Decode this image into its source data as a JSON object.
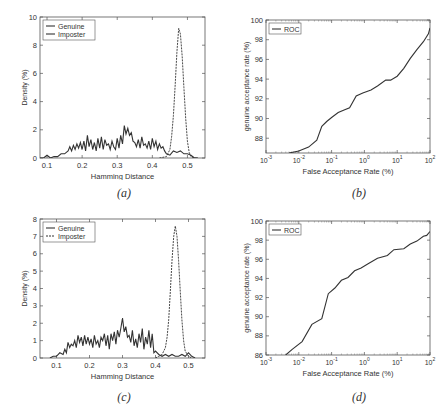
{
  "chart_data": [
    {
      "id": "a",
      "type": "line",
      "caption": "(a)",
      "xlabel": "Hamming Distance",
      "ylabel": "Density (%)",
      "xlim": [
        0.08,
        0.55
      ],
      "ylim": [
        0,
        10
      ],
      "xticks": [
        0.1,
        0.2,
        0.3,
        0.4,
        0.5
      ],
      "xtick_labels": [
        "0.1",
        "0.2",
        "0.3",
        "0.4",
        "0.5"
      ],
      "yticks": [
        0,
        2,
        4,
        6,
        8,
        10
      ],
      "ytick_labels": [
        "0",
        "2",
        "4",
        "6",
        "8",
        "10"
      ],
      "legend": {
        "position": "upper left",
        "entries": [
          "Genuine",
          "Imposter"
        ]
      },
      "series": [
        {
          "name": "Genuine",
          "style": "solid",
          "x": [
            0.08,
            0.09,
            0.1,
            0.11,
            0.12,
            0.13,
            0.14,
            0.15,
            0.16,
            0.165,
            0.17,
            0.175,
            0.18,
            0.185,
            0.19,
            0.195,
            0.2,
            0.205,
            0.21,
            0.215,
            0.22,
            0.225,
            0.23,
            0.235,
            0.24,
            0.245,
            0.25,
            0.255,
            0.26,
            0.265,
            0.27,
            0.275,
            0.28,
            0.285,
            0.29,
            0.295,
            0.3,
            0.305,
            0.31,
            0.315,
            0.32,
            0.325,
            0.33,
            0.335,
            0.34,
            0.345,
            0.35,
            0.355,
            0.36,
            0.365,
            0.37,
            0.375,
            0.38,
            0.385,
            0.39,
            0.395,
            0.4,
            0.405,
            0.41,
            0.415,
            0.42,
            0.425,
            0.43,
            0.435,
            0.44,
            0.45,
            0.46,
            0.47,
            0.48,
            0.49,
            0.5,
            0.51,
            0.52,
            0.53
          ],
          "values": [
            0,
            0,
            0.2,
            0,
            0.1,
            0.1,
            0.3,
            0.3,
            0.5,
            0.8,
            0.5,
            0.9,
            0.6,
            1.0,
            0.7,
            1.1,
            0.6,
            1.2,
            0.5,
            1.6,
            0.8,
            1.3,
            0.6,
            1.1,
            0.5,
            1.4,
            0.7,
            1.5,
            0.6,
            1.3,
            0.9,
            1.0,
            0.6,
            1.2,
            0.8,
            0.6,
            1.4,
            0.7,
            1.6,
            1.0,
            2.3,
            1.7,
            2.1,
            1.6,
            1.8,
            1.2,
            1.1,
            0.8,
            1.3,
            0.7,
            1.5,
            0.9,
            1.0,
            0.7,
            1.2,
            0.6,
            1.4,
            0.8,
            1.2,
            0.6,
            1.0,
            0.7,
            0.8,
            0.5,
            0.3,
            0.2,
            0.5,
            0.4,
            0.5,
            0.3,
            0.3,
            0.2,
            0,
            0
          ]
        },
        {
          "name": "Imposter",
          "style": "dashed",
          "x": [
            0.42,
            0.44,
            0.45,
            0.455,
            0.46,
            0.465,
            0.47,
            0.475,
            0.48,
            0.485,
            0.49,
            0.495,
            0.5,
            0.505,
            0.51,
            0.52,
            0.53
          ],
          "values": [
            0,
            0.1,
            0.6,
            1.5,
            3.0,
            5.2,
            7.5,
            9.2,
            8.8,
            7.2,
            5.0,
            2.8,
            1.2,
            0.4,
            0.1,
            0,
            0
          ]
        }
      ]
    },
    {
      "id": "b",
      "type": "line",
      "caption": "(b)",
      "xlabel": "False Acceptance Rate (%)",
      "ylabel": "genuine acceptance rate (%)",
      "xscale": "log",
      "xlim": [
        0.001,
        100
      ],
      "ylim": [
        86.5,
        100
      ],
      "xticks": [
        0.001,
        0.01,
        0.1,
        1,
        10,
        100
      ],
      "xtick_labels": [
        "10^-3",
        "10^-2",
        "10^-1",
        "10^0",
        "10^1",
        "10^2"
      ],
      "yticks": [
        88,
        90,
        92,
        94,
        96,
        98,
        100
      ],
      "ytick_labels": [
        "88",
        "90",
        "92",
        "94",
        "96",
        "98",
        "100"
      ],
      "legend": {
        "position": "upper left",
        "entries": [
          "ROC"
        ]
      },
      "series": [
        {
          "name": "ROC",
          "style": "solid",
          "x_log10": [
            -2.3,
            -2.0,
            -1.7,
            -1.45,
            -1.3,
            -1.15,
            -1.0,
            -0.8,
            -0.6,
            -0.45,
            -0.25,
            -0.05,
            0.2,
            0.4,
            0.65,
            0.8,
            1.0,
            1.2,
            1.4,
            1.6,
            1.8,
            1.95,
            2.0
          ],
          "values": [
            86.5,
            86.7,
            87.1,
            87.8,
            89.2,
            89.7,
            90.1,
            90.6,
            90.9,
            91.1,
            92.3,
            92.6,
            92.9,
            93.3,
            93.9,
            93.9,
            94.3,
            95.1,
            96.1,
            97.0,
            97.8,
            98.6,
            99.2
          ]
        }
      ]
    },
    {
      "id": "c",
      "type": "line",
      "caption": "(c)",
      "xlabel": "Hamming Distance",
      "ylabel": "Density (%)",
      "xlim": [
        0.05,
        0.55
      ],
      "ylim": [
        0,
        8
      ],
      "xticks": [
        0.1,
        0.2,
        0.3,
        0.4,
        0.5
      ],
      "xtick_labels": [
        "0.1",
        "0.2",
        "0.3",
        "0.4",
        "0.5"
      ],
      "yticks": [
        0,
        1,
        2,
        3,
        4,
        5,
        6,
        7,
        8
      ],
      "ytick_labels": [
        "0",
        "1",
        "2",
        "3",
        "4",
        "5",
        "6",
        "7",
        "8"
      ],
      "legend": {
        "position": "upper left",
        "entries": [
          "Genuine",
          "Imposter"
        ]
      },
      "series": [
        {
          "name": "Genuine",
          "style": "solid",
          "x": [
            0.08,
            0.09,
            0.1,
            0.11,
            0.12,
            0.125,
            0.13,
            0.135,
            0.14,
            0.145,
            0.15,
            0.155,
            0.16,
            0.165,
            0.17,
            0.175,
            0.18,
            0.185,
            0.19,
            0.195,
            0.2,
            0.205,
            0.21,
            0.215,
            0.22,
            0.225,
            0.23,
            0.235,
            0.24,
            0.245,
            0.25,
            0.255,
            0.26,
            0.265,
            0.27,
            0.275,
            0.28,
            0.285,
            0.29,
            0.295,
            0.3,
            0.305,
            0.31,
            0.315,
            0.32,
            0.325,
            0.33,
            0.335,
            0.34,
            0.345,
            0.35,
            0.355,
            0.36,
            0.365,
            0.37,
            0.375,
            0.38,
            0.385,
            0.39,
            0.395,
            0.4,
            0.41,
            0.42,
            0.43,
            0.44,
            0.45,
            0.46,
            0.47,
            0.48,
            0.49,
            0.5,
            0.51,
            0.52
          ],
          "values": [
            0,
            0.1,
            0.1,
            0.3,
            0.2,
            0.5,
            0.3,
            0.9,
            0.6,
            0.8,
            0.7,
            1.0,
            0.6,
            1.3,
            0.9,
            1.2,
            0.7,
            1.3,
            0.8,
            1.2,
            0.8,
            1.1,
            0.6,
            1.3,
            0.8,
            1.0,
            0.6,
            1.2,
            1.0,
            1.4,
            0.7,
            1.3,
            0.5,
            1.4,
            1.0,
            1.5,
            0.8,
            1.6,
            1.2,
            1.7,
            2.3,
            1.5,
            1.8,
            1.2,
            1.3,
            0.9,
            1.6,
            0.7,
            1.1,
            0.6,
            1.4,
            0.9,
            1.7,
            0.5,
            1.2,
            0.8,
            1.6,
            0.6,
            1.4,
            0.3,
            0.4,
            0.2,
            0.1,
            0.2,
            0.1,
            0.2,
            0.1,
            0.1,
            0.2,
            0.1,
            0.3,
            0.1,
            0
          ]
        },
        {
          "name": "Imposter",
          "style": "dashed",
          "x": [
            0.4,
            0.42,
            0.43,
            0.435,
            0.44,
            0.445,
            0.45,
            0.455,
            0.46,
            0.465,
            0.47,
            0.475,
            0.48,
            0.485,
            0.49,
            0.5,
            0.51
          ],
          "values": [
            0,
            0.2,
            0.6,
            1.2,
            2.2,
            3.8,
            5.6,
            7.0,
            7.6,
            7.0,
            5.6,
            3.8,
            2.2,
            1.0,
            0.4,
            0.1,
            0
          ]
        }
      ]
    },
    {
      "id": "d",
      "type": "line",
      "caption": "(d)",
      "xlabel": "False Acceptance Rate (%)",
      "ylabel": "genuine acceptance rate (%)",
      "xscale": "log",
      "xlim": [
        0.001,
        100
      ],
      "ylim": [
        86,
        100
      ],
      "xticks": [
        0.001,
        0.01,
        0.1,
        1,
        10,
        100
      ],
      "xtick_labels": [
        "10^-3",
        "10^-2",
        "10^-1",
        "10^0",
        "10^1",
        "10^2"
      ],
      "yticks": [
        86,
        88,
        90,
        92,
        94,
        96,
        98,
        100
      ],
      "ytick_labels": [
        "86",
        "88",
        "90",
        "92",
        "94",
        "96",
        "98",
        "100"
      ],
      "legend": {
        "position": "upper left",
        "entries": [
          "ROC"
        ]
      },
      "series": [
        {
          "name": "ROC",
          "style": "solid",
          "x_log10": [
            -2.4,
            -2.2,
            -1.9,
            -1.6,
            -1.3,
            -1.1,
            -0.9,
            -0.7,
            -0.5,
            -0.3,
            -0.1,
            0.1,
            0.4,
            0.7,
            0.9,
            1.2,
            1.4,
            1.6,
            1.8,
            1.9,
            2.0
          ],
          "values": [
            86,
            86.6,
            87.4,
            89.2,
            89.8,
            92.4,
            93.0,
            93.8,
            94.1,
            94.8,
            95.1,
            95.5,
            96.1,
            96.4,
            97.0,
            97.1,
            97.6,
            97.9,
            98.4,
            98.5,
            98.9
          ]
        }
      ]
    }
  ],
  "figure": {
    "captions": [
      "(a)",
      "(b)",
      "(c)",
      "(d)"
    ],
    "legend_labels": {
      "genuine": "Genuine",
      "imposter": "Imposter",
      "roc": "ROC"
    },
    "axis_labels": {
      "hamming": "Hamming Distance",
      "density": "Density (%)",
      "far": "False Acceptance Rate (%)",
      "gar": "genuine acceptance rate (%)"
    }
  }
}
